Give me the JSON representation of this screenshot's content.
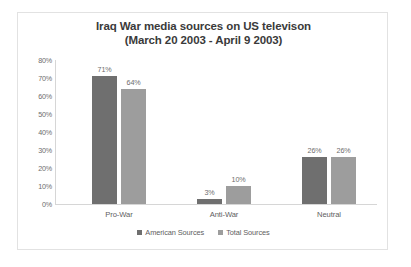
{
  "chart_data": {
    "type": "bar",
    "title": "Iraq War media sources on US televison",
    "subtitle": "(March 20 2003 - April 9 2003)",
    "xlabel": "",
    "ylabel": "",
    "ylim": [
      0,
      80
    ],
    "ytick_labels": [
      "80%",
      "70%",
      "60%",
      "50%",
      "40%",
      "30%",
      "20%",
      "10%",
      "0%"
    ],
    "ytick_values": [
      80,
      70,
      60,
      50,
      40,
      30,
      20,
      10,
      0
    ],
    "grid": false,
    "legend_position": "bottom",
    "categories": [
      "Pro-War",
      "Anti-War",
      "Neutral"
    ],
    "series": [
      {
        "name": "American Sources",
        "color": "#6f6f6f",
        "values": [
          71,
          3,
          26
        ],
        "labels": [
          "71%",
          "3%",
          "26%"
        ]
      },
      {
        "name": "Total Sources",
        "color": "#9d9d9d",
        "values": [
          64,
          10,
          26
        ],
        "labels": [
          "64%",
          "10%",
          "26%"
        ]
      }
    ]
  }
}
